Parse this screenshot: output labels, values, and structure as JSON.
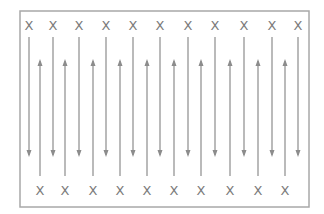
{
  "diagram": {
    "colors": {
      "line": "#8c8c8c",
      "border": "#a8a8a8",
      "marker": "#7a7a7a"
    },
    "frame": {
      "x": 20,
      "y": 11,
      "width": 289,
      "height": 196
    },
    "marker_label": "X",
    "top_markers": [
      29,
      53,
      79,
      106,
      133,
      160,
      188,
      215,
      244,
      272,
      298
    ],
    "bottom_markers": [
      40,
      65,
      93,
      120,
      147,
      174,
      201,
      230,
      258,
      285
    ],
    "top_marker_y": 25,
    "bottom_marker_y": 190,
    "down_arrows": {
      "x": [
        29,
        53,
        79,
        106,
        133,
        160,
        188,
        215,
        244,
        272,
        298
      ],
      "y_start": 37,
      "y_end": 155
    },
    "up_arrows": {
      "x": [
        40,
        65,
        93,
        120,
        147,
        174,
        201,
        230,
        258,
        285
      ],
      "y_start": 176,
      "y_end": 61
    }
  }
}
